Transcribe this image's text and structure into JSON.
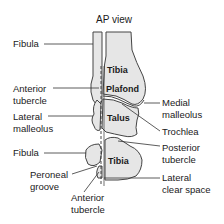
{
  "title": "AP view",
  "bone_labels": {
    "tibia_upper": "Tibia",
    "plafond": "Plafond",
    "talus": "Talus",
    "tibia_lower": "Tibia"
  },
  "left_labels": {
    "fibula_upper": "Fibula",
    "anterior_tubercle_upper_1": "Anterior",
    "anterior_tubercle_upper_2": "tubercle",
    "lateral_malleolus_1": "Lateral",
    "lateral_malleolus_2": "malleolus",
    "fibula_lower": "Fibula",
    "peroneal_groove_1": "Peroneal",
    "peroneal_groove_2": "groove",
    "anterior_tubercle_lower_1": "Anterior",
    "anterior_tubercle_lower_2": "tubercle"
  },
  "right_labels": {
    "medial_malleolus_1": "Medial",
    "medial_malleolus_2": "malleolus",
    "trochlea": "Trochlea",
    "posterior_tubercle_1": "Posterior",
    "posterior_tubercle_2": "tubercle",
    "lateral_clear_space_1": "Lateral",
    "lateral_clear_space_2": "clear space"
  },
  "colors": {
    "bone_fill": "#e6e6e6",
    "outline": "#333333"
  }
}
